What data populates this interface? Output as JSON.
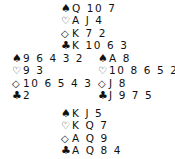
{
  "deal": {
    "north": {
      "spades": "Q 10 7",
      "hearts": "A J 4",
      "diamonds": "K 7 2",
      "clubs": "K 10 6 3"
    },
    "west": {
      "spades": "9 6 4 3 2",
      "hearts": "9 3",
      "diamonds": "10 6 5 4 3",
      "clubs": "2"
    },
    "east": {
      "spades": "A 8",
      "hearts": "10 8 6 5 2",
      "diamonds": "J 8",
      "clubs": "J 9 7 5"
    },
    "south": {
      "spades": "K J 5",
      "hearts": "K Q 7",
      "diamonds": "A Q 9",
      "clubs": "A Q 8 4"
    }
  },
  "suits": {
    "spades": "♠",
    "hearts": "♡",
    "diamonds": "◇",
    "clubs": "♣"
  }
}
